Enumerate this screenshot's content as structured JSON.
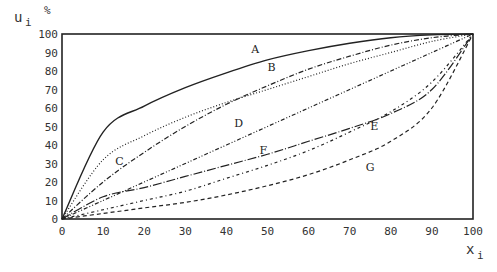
{
  "chart_data": {
    "type": "line",
    "title": "",
    "xlabel": "x_i",
    "ylabel": "u_i",
    "y_unit": "%",
    "xlim": [
      0,
      100
    ],
    "ylim": [
      0,
      100
    ],
    "x_ticks": [
      0,
      10,
      20,
      30,
      40,
      50,
      60,
      70,
      80,
      90,
      100
    ],
    "y_ticks": [
      0,
      10,
      20,
      30,
      40,
      50,
      60,
      70,
      80,
      90,
      100
    ],
    "grid": false,
    "legend": "inline labels",
    "x": [
      0,
      10,
      20,
      30,
      40,
      50,
      60,
      70,
      80,
      90,
      100
    ],
    "series": [
      {
        "name": "A",
        "style": "solid",
        "values": [
          0,
          47,
          61,
          71,
          79,
          86,
          91,
          95,
          98,
          99.5,
          100
        ],
        "label_at": [
          47,
          90
        ]
      },
      {
        "name": "B",
        "style": "dashdot",
        "values": [
          0,
          20,
          36,
          50,
          62,
          72,
          81,
          88,
          94,
          98,
          100
        ],
        "label_at": [
          51,
          80
        ]
      },
      {
        "name": "C",
        "style": "dotted",
        "values": [
          0,
          32,
          45,
          55,
          63,
          70,
          77,
          84,
          90,
          96,
          100
        ],
        "label_at": [
          14,
          29
        ]
      },
      {
        "name": "D",
        "style": "dashdotdot",
        "values": [
          0,
          10,
          20,
          30,
          40,
          50,
          60,
          70,
          80,
          90,
          100
        ],
        "label_at": [
          43,
          50
        ]
      },
      {
        "name": "E",
        "style": "dashdot-sparse",
        "values": [
          0,
          5,
          10,
          15,
          22,
          29,
          37,
          47,
          58,
          74,
          100
        ],
        "label_at": [
          76,
          48
        ]
      },
      {
        "name": "F",
        "style": "longdash-dot",
        "values": [
          0,
          12,
          17,
          23,
          29,
          35,
          42,
          49,
          57,
          70,
          100
        ],
        "label_at": [
          49,
          35
        ]
      },
      {
        "name": "G",
        "style": "dashed",
        "values": [
          0,
          3,
          6,
          9,
          13,
          18,
          24,
          32,
          42,
          60,
          100
        ],
        "label_at": [
          75,
          26
        ]
      }
    ]
  },
  "axes": {
    "y_label": "u",
    "y_sub": "i",
    "x_label": "x",
    "x_sub": "i",
    "unit": "%"
  }
}
